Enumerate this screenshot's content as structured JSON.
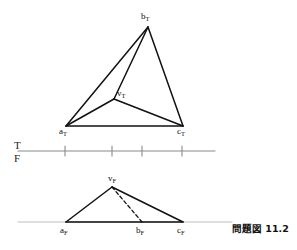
{
  "figure": {
    "caption": "問題図 11.2",
    "reference_line": {
      "upper_plane_label": "T",
      "lower_plane_label": "F",
      "x_start": 18,
      "x_end": 215,
      "y": 151,
      "color": "#8a8a8a",
      "tick_positions": [
        65,
        112,
        142,
        182
      ],
      "tick_half_height": 5
    },
    "line_color": "#111111",
    "top_view": {
      "name": "top-view",
      "points": {
        "a": {
          "label": "a",
          "sub": "T",
          "x": 66,
          "y": 126,
          "label_x": 59,
          "label_y": 127
        },
        "b": {
          "label": "b",
          "sub": "T",
          "x": 148,
          "y": 27,
          "label_x": 141,
          "label_y": 12
        },
        "c": {
          "label": "c",
          "sub": "T",
          "x": 183,
          "y": 126,
          "label_x": 177,
          "label_y": 127
        },
        "v": {
          "label": "v",
          "sub": "T",
          "x": 114,
          "y": 99,
          "label_x": 117,
          "label_y": 89
        }
      },
      "edges": [
        {
          "name": "edge-a-b",
          "from": "a",
          "to": "b",
          "style": "solid"
        },
        {
          "name": "edge-b-c",
          "from": "b",
          "to": "c",
          "style": "solid"
        },
        {
          "name": "edge-a-c",
          "from": "a",
          "to": "c",
          "style": "solid"
        },
        {
          "name": "edge-v-a",
          "from": "v",
          "to": "a",
          "style": "solid"
        },
        {
          "name": "edge-v-b",
          "from": "v",
          "to": "b",
          "style": "solid"
        },
        {
          "name": "edge-v-c",
          "from": "v",
          "to": "c",
          "style": "solid"
        }
      ]
    },
    "front_view": {
      "name": "front-view",
      "ground_line": {
        "x_start": 18,
        "x_end": 232,
        "y": 222,
        "color": "#bdbdbd"
      },
      "points": {
        "a": {
          "label": "a",
          "sub": "F",
          "x": 66,
          "y": 222,
          "label_x": 60,
          "label_y": 226
        },
        "b": {
          "label": "b",
          "sub": "F",
          "x": 142,
          "y": 222,
          "label_x": 136,
          "label_y": 226
        },
        "c": {
          "label": "c",
          "sub": "F",
          "x": 183,
          "y": 222,
          "label_x": 177,
          "label_y": 226
        },
        "v": {
          "label": "v",
          "sub": "F",
          "x": 112,
          "y": 187,
          "label_x": 108,
          "label_y": 174
        }
      },
      "edges": [
        {
          "name": "edge-a-v",
          "from": "a",
          "to": "v",
          "style": "solid"
        },
        {
          "name": "edge-v-c",
          "from": "v",
          "to": "c",
          "style": "solid"
        },
        {
          "name": "edge-a-c",
          "from": "a",
          "to": "c",
          "style": "solid"
        },
        {
          "name": "edge-v-b-hidden",
          "from": "v",
          "to": "b",
          "style": "dashed"
        }
      ]
    }
  }
}
